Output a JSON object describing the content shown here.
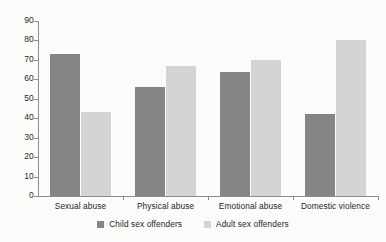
{
  "chart_data": {
    "type": "bar",
    "title": "",
    "xlabel": "",
    "ylabel": "",
    "ylim": [
      0,
      90
    ],
    "yticks": [
      0,
      10,
      20,
      30,
      40,
      50,
      60,
      70,
      80,
      90
    ],
    "grid": false,
    "legend_position": "bottom-center",
    "categories": [
      "Sexual abuse",
      "Physical abuse",
      "Emotional abuse",
      "Domestic violence"
    ],
    "series": [
      {
        "name": "Child sex offenders",
        "color": "#858585",
        "values": [
          73,
          56,
          64,
          42
        ]
      },
      {
        "name": "Adult sex offenders",
        "color": "#d4d4d4",
        "values": [
          43,
          67,
          70,
          80
        ]
      }
    ]
  },
  "colors": {
    "series_child": "#858585",
    "series_adult": "#d4d4d4",
    "axis": "#8d8d8d",
    "background": "#fbfbfa",
    "text": "#1f1f1f"
  }
}
